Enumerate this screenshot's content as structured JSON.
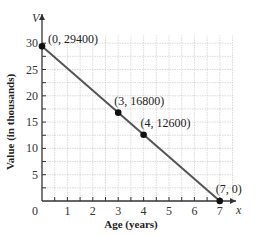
{
  "chart_data": {
    "type": "line",
    "title": "",
    "xlabel": "Age (years)",
    "ylabel": "Value (in thousands)",
    "x_var": "x",
    "y_var": "V",
    "xlim": [
      0,
      7.6
    ],
    "ylim": [
      0,
      31
    ],
    "x_ticks": [
      0,
      1,
      2,
      3,
      4,
      5,
      6,
      7
    ],
    "x_tick_labels": [
      "0",
      "1",
      "2",
      "3",
      "4",
      "5",
      "6",
      "7"
    ],
    "y_ticks": [
      5,
      10,
      15,
      20,
      25,
      30
    ],
    "y_tick_labels": [
      "5",
      "10",
      "15",
      "20",
      "25",
      "30"
    ],
    "grid": true,
    "series": [
      {
        "name": "Value",
        "x": [
          0,
          7
        ],
        "values": [
          29.4,
          0
        ]
      }
    ],
    "points": [
      {
        "x": 0,
        "y": 29.4,
        "label": "(0, 29400)"
      },
      {
        "x": 3,
        "y": 16.8,
        "label": "(3, 16800)"
      },
      {
        "x": 4,
        "y": 12.6,
        "label": "(4, 12600)"
      },
      {
        "x": 7,
        "y": 0,
        "label": "(7, 0)"
      }
    ],
    "colors": {
      "line": "#555555",
      "point": "#111111",
      "grid": "#cccccc",
      "axis": "#333333"
    }
  }
}
